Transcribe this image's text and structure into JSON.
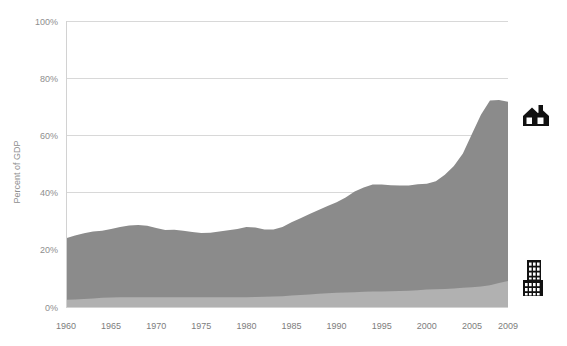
{
  "chart_data": {
    "type": "area",
    "stacked": true,
    "title": "",
    "subtitle": "",
    "xlabel": "",
    "ylabel": "Percent of GDP",
    "xlim": [
      1960,
      2009
    ],
    "ylim": [
      0,
      100
    ],
    "grid": true,
    "legend_position": "right-icons",
    "y_tick_labels": [
      "0%",
      "20%",
      "40%",
      "60%",
      "80%",
      "100%"
    ],
    "y_tick_values": [
      0,
      20,
      40,
      60,
      80,
      100
    ],
    "x_tick_labels": [
      "1960",
      "1965",
      "1970",
      "1975",
      "1980",
      "1985",
      "1990",
      "1995",
      "2000",
      "2005",
      "2009"
    ],
    "x_tick_values": [
      1960,
      1965,
      1970,
      1975,
      1980,
      1985,
      1990,
      1995,
      2000,
      2005,
      2009
    ],
    "x": [
      1960,
      1961,
      1962,
      1963,
      1964,
      1965,
      1966,
      1967,
      1968,
      1969,
      1970,
      1971,
      1972,
      1973,
      1974,
      1975,
      1976,
      1977,
      1978,
      1979,
      1980,
      1981,
      1982,
      1983,
      1984,
      1985,
      1986,
      1987,
      1988,
      1989,
      1990,
      1991,
      1992,
      1993,
      1994,
      1995,
      1996,
      1997,
      1998,
      1999,
      2000,
      2001,
      2002,
      2003,
      2004,
      2005,
      2006,
      2007,
      2008,
      2009
    ],
    "series": [
      {
        "name": "commercial",
        "icon": "office-building-icon",
        "color": "#b1b1b1",
        "values": [
          2.5,
          2.6,
          2.8,
          3.0,
          3.2,
          3.3,
          3.4,
          3.4,
          3.4,
          3.4,
          3.4,
          3.4,
          3.4,
          3.4,
          3.4,
          3.4,
          3.4,
          3.4,
          3.4,
          3.4,
          3.4,
          3.5,
          3.6,
          3.7,
          3.8,
          4.0,
          4.2,
          4.4,
          4.6,
          4.8,
          5.0,
          5.1,
          5.2,
          5.3,
          5.4,
          5.4,
          5.5,
          5.6,
          5.7,
          5.9,
          6.1,
          6.2,
          6.3,
          6.5,
          6.7,
          6.9,
          7.2,
          7.6,
          8.4,
          9.1
        ]
      },
      {
        "name": "residential",
        "icon": "house-icon",
        "color": "#8b8b8b",
        "values": [
          21.5,
          22.4,
          23.0,
          23.4,
          23.5,
          24.0,
          24.6,
          25.1,
          25.3,
          25.0,
          24.2,
          23.5,
          23.6,
          23.3,
          22.8,
          22.5,
          22.6,
          23.0,
          23.4,
          23.9,
          24.6,
          24.3,
          23.5,
          23.4,
          24.2,
          25.6,
          26.8,
          28.1,
          29.3,
          30.5,
          31.6,
          33.2,
          35.2,
          36.5,
          37.4,
          37.4,
          37.1,
          36.9,
          36.8,
          37.0,
          37.0,
          37.8,
          39.9,
          42.8,
          47.0,
          53.6,
          60.0,
          64.6,
          64.0,
          62.7
        ]
      }
    ],
    "stack_totals": [
      24.0,
      25.0,
      25.8,
      26.4,
      26.7,
      27.3,
      28.0,
      28.5,
      28.7,
      28.4,
      27.6,
      26.9,
      27.0,
      26.7,
      26.2,
      25.9,
      26.0,
      26.4,
      26.8,
      27.3,
      28.0,
      27.8,
      27.1,
      27.1,
      28.0,
      29.6,
      31.0,
      32.5,
      33.9,
      35.3,
      36.6,
      38.3,
      40.4,
      41.8,
      42.8,
      42.8,
      42.6,
      42.5,
      42.5,
      42.9,
      43.1,
      44.0,
      46.2,
      49.3,
      53.7,
      60.5,
      67.2,
      72.2,
      72.4,
      71.8
    ]
  },
  "legend": {
    "residential_icon_name": "house-icon",
    "commercial_icon_name": "office-building-icon"
  },
  "colors": {
    "residential": "#8b8b8b",
    "commercial": "#b1b1b1",
    "gridline": "#d8d8d8",
    "tick_text": "#8e8e8e",
    "xtick_text": "#7d7d7d",
    "icon": "#111111",
    "background": "#ffffff"
  }
}
